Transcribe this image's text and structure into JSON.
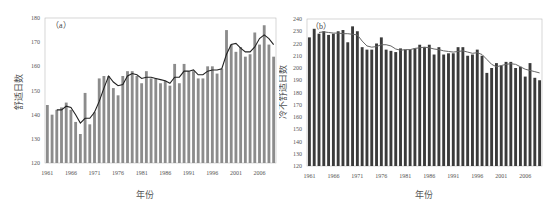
{
  "chart_data": [
    {
      "type": "bar",
      "panel_label": "（a）",
      "title": "",
      "xlabel": "年份",
      "ylabel": "舒适日数",
      "ylim": [
        120,
        180
      ],
      "yticks": [
        120,
        130,
        140,
        150,
        160,
        170,
        180
      ],
      "xtick_labels": [
        "1961",
        "1966",
        "1971",
        "1976",
        "1981",
        "1986",
        "1991",
        "1996",
        "2001",
        "2006"
      ],
      "grid": false,
      "legend": null,
      "bar_color": "#8c8c8c",
      "line_color": "#222222",
      "x": [
        1961,
        1962,
        1963,
        1964,
        1965,
        1966,
        1967,
        1968,
        1969,
        1970,
        1971,
        1972,
        1973,
        1974,
        1975,
        1976,
        1977,
        1978,
        1979,
        1980,
        1981,
        1982,
        1983,
        1984,
        1985,
        1986,
        1987,
        1988,
        1989,
        1990,
        1991,
        1992,
        1993,
        1994,
        1995,
        1996,
        1997,
        1998,
        1999,
        2000,
        2001,
        2002,
        2003,
        2004,
        2005,
        2006,
        2007,
        2008,
        2009
      ],
      "series": [
        {
          "name": "舒适日数",
          "kind": "bar",
          "values": [
            144,
            140,
            142,
            143,
            145,
            142,
            137,
            132,
            149,
            136,
            141,
            155,
            156,
            156,
            151,
            148,
            156,
            158,
            158,
            156,
            153,
            158,
            155,
            155,
            153,
            154,
            152,
            161,
            153,
            161,
            158,
            158,
            155,
            155,
            160,
            160,
            157,
            159,
            175,
            169,
            166,
            168,
            164,
            165,
            174,
            169,
            177,
            169,
            164
          ]
        },
        {
          "name": "滑动平均",
          "kind": "line",
          "values": [
            null,
            null,
            142,
            142,
            143.5,
            143,
            140,
            136.5,
            138.5,
            138.5,
            141,
            145.5,
            151,
            156,
            153.5,
            152,
            152.5,
            156,
            157,
            156.5,
            155,
            155.5,
            155.5,
            155,
            154.5,
            154,
            153,
            155.5,
            155.5,
            158,
            158,
            158.5,
            156.5,
            156.5,
            158,
            158.5,
            158.5,
            159,
            165,
            169,
            169.5,
            167.5,
            166,
            166,
            168,
            171.5,
            173,
            171.5,
            169
          ]
        }
      ]
    },
    {
      "type": "bar",
      "panel_label": "（b）",
      "title": "",
      "xlabel": "年份",
      "ylabel": "冷不舒适日数",
      "ylim": [
        120,
        240
      ],
      "yticks": [
        120,
        130,
        140,
        150,
        160,
        170,
        180,
        190,
        200,
        210,
        220,
        230,
        240
      ],
      "xtick_labels": [
        "1961",
        "1966",
        "1971",
        "1976",
        "1981",
        "1986",
        "1991",
        "1996",
        "2001",
        "2006"
      ],
      "grid": false,
      "legend": null,
      "bar_color": "#3a3a3a",
      "line_color": "#666666",
      "x": [
        1961,
        1962,
        1963,
        1964,
        1965,
        1966,
        1967,
        1968,
        1969,
        1970,
        1971,
        1972,
        1973,
        1974,
        1975,
        1976,
        1977,
        1978,
        1979,
        1980,
        1981,
        1982,
        1983,
        1984,
        1985,
        1986,
        1987,
        1988,
        1989,
        1990,
        1991,
        1992,
        1993,
        1994,
        1995,
        1996,
        1997,
        1998,
        1999,
        2000,
        2001,
        2002,
        2003,
        2004,
        2005,
        2006,
        2007,
        2008,
        2009
      ],
      "series": [
        {
          "name": "冷不舒适日数",
          "kind": "bar",
          "values": [
            225,
            232,
            228,
            230,
            227,
            228,
            230,
            231,
            221,
            234,
            230,
            217,
            215,
            215,
            220,
            225,
            215,
            214,
            213,
            216,
            215,
            215,
            216,
            219,
            217,
            219,
            211,
            217,
            211,
            212,
            212,
            217,
            217,
            210,
            211,
            215,
            210,
            196,
            200,
            204,
            202,
            205,
            205,
            200,
            201,
            193,
            204,
            192,
            190
          ]
        },
        {
          "name": "滑动平均",
          "kind": "line",
          "values": [
            null,
            null,
            229,
            229.5,
            229,
            228.5,
            228.5,
            228,
            228,
            227.5,
            227,
            222,
            218,
            217,
            217.5,
            219,
            219,
            218,
            215.5,
            214.5,
            215,
            215,
            216,
            216.5,
            217,
            216.5,
            215.5,
            215,
            214,
            213.5,
            213,
            213.5,
            214,
            213,
            212,
            212.5,
            211,
            207,
            203,
            201,
            202,
            203,
            203.5,
            203,
            201,
            199,
            198,
            197,
            196
          ]
        }
      ]
    }
  ],
  "panel_a": {
    "label": "（a）",
    "ylabel": "舒适日数",
    "xlabel": "年份",
    "yticks": [
      "120",
      "130",
      "140",
      "150",
      "160",
      "170",
      "180"
    ],
    "xticks": [
      "1961",
      "1966",
      "1971",
      "1976",
      "1981",
      "1986",
      "1991",
      "1996",
      "2001",
      "2006"
    ]
  },
  "panel_b": {
    "label": "（b）",
    "ylabel": "冷不舒适日数",
    "xlabel": "年份",
    "yticks": [
      "120",
      "130",
      "140",
      "150",
      "160",
      "170",
      "180",
      "190",
      "200",
      "210",
      "220",
      "230",
      "240"
    ],
    "xticks": [
      "1961",
      "1966",
      "1971",
      "1976",
      "1981",
      "1986",
      "1991",
      "1996",
      "2001",
      "2006"
    ]
  }
}
